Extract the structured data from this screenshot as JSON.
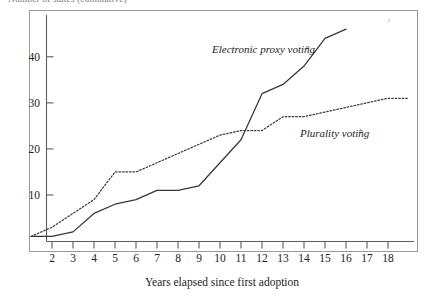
{
  "figure": {
    "clipped_title": "Number of states (cumulative)",
    "background_color": "#ffffff",
    "frame_color": "#9a9a9a",
    "ink_color": "#37373a"
  },
  "chart_data": {
    "type": "line",
    "title": "Number of states (cumulative)",
    "xlabel": "Years elapsed since first adoption",
    "ylabel": "",
    "xlim": [
      1,
      19
    ],
    "ylim": [
      0,
      48
    ],
    "grid": false,
    "legend_position": "inline-annotation",
    "xticks": [
      2,
      3,
      4,
      5,
      6,
      7,
      8,
      9,
      10,
      11,
      12,
      13,
      14,
      15,
      16,
      17,
      18
    ],
    "yticks": [
      10,
      20,
      30,
      40
    ],
    "series": [
      {
        "name": "Electronic proxy voting",
        "footnote": "a",
        "style": "solid",
        "label_text": "Electronic proxy voting",
        "x": [
          1,
          2,
          3,
          4,
          5,
          6,
          7,
          8,
          9,
          10,
          11,
          12,
          13,
          14,
          15,
          16
        ],
        "values": [
          1,
          1,
          2,
          6,
          8,
          9,
          11,
          11,
          12,
          17,
          22,
          32,
          34,
          38,
          44,
          46
        ]
      },
      {
        "name": "Plurality voting",
        "footnote": "b",
        "style": "dotted",
        "label_text": "Plurality voting",
        "x": [
          1,
          2,
          3,
          4,
          5,
          6,
          7,
          8,
          9,
          10,
          11,
          12,
          13,
          14,
          15,
          16,
          17,
          18,
          19
        ],
        "values": [
          1,
          3,
          6,
          9,
          15,
          15,
          17,
          19,
          21,
          23,
          24,
          24,
          27,
          27,
          28,
          29,
          30,
          31,
          31
        ]
      }
    ]
  },
  "annotations": {
    "electronic": {
      "label": "Electronic proxy voting",
      "sup": "a"
    },
    "plurality": {
      "label": "Plurality voting",
      "sup": "b"
    }
  },
  "axis": {
    "x_title": "Years elapsed since first adoption"
  }
}
